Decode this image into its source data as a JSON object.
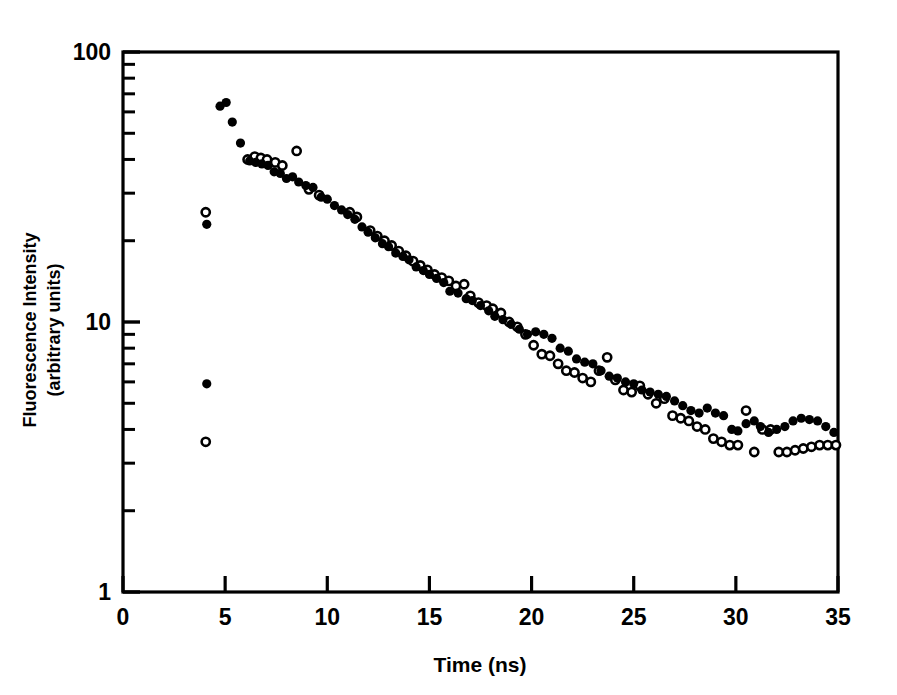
{
  "figure": {
    "name": "fluorescence-decay-plot",
    "background_color": "#ffffff",
    "ink_color": "#000000"
  },
  "axes": {
    "frame": {
      "left": 123,
      "right": 838,
      "top": 52,
      "bottom": 592
    },
    "x": {
      "title": "Time (ns)",
      "min": 0,
      "max": 35,
      "scale": "linear",
      "tick_labels": [
        "0",
        "5",
        "10",
        "15",
        "20",
        "25",
        "30",
        "35"
      ],
      "tick_values": [
        0,
        5,
        10,
        15,
        20,
        25,
        30,
        35
      ]
    },
    "y": {
      "title_line1": "Fluorescence Intensity",
      "title_line2": "(arbitrary units)",
      "min": 1,
      "max": 100,
      "scale": "log",
      "tick_labels": [
        "100",
        "10",
        "1"
      ],
      "tick_values": [
        100,
        10,
        1
      ],
      "minor_ticks": [
        2,
        3,
        4,
        5,
        6,
        7,
        8,
        9,
        20,
        30,
        40,
        50,
        60,
        70,
        80,
        90
      ]
    }
  },
  "chart_data": {
    "type": "scatter",
    "title": "",
    "xlabel": "Time (ns)",
    "ylabel": "Fluorescence Intensity (arbitrary units)",
    "xlim": [
      0,
      35
    ],
    "ylim": [
      1,
      100
    ],
    "yscale": "log",
    "xscale": "linear",
    "grid": false,
    "legend": "none",
    "marker_radius_px": 4.6,
    "series": [
      {
        "name": "filled-circles",
        "marker": "filled-circle",
        "color": "#000000",
        "points": [
          [
            4.1,
            23.0
          ],
          [
            4.1,
            5.9
          ],
          [
            4.75,
            63.0
          ],
          [
            5.05,
            65.0
          ],
          [
            5.35,
            55.0
          ],
          [
            5.75,
            46.0
          ],
          [
            6.2,
            39.5
          ],
          [
            6.5,
            39.0
          ],
          [
            6.8,
            38.5
          ],
          [
            7.1,
            38.0
          ],
          [
            7.4,
            36.0
          ],
          [
            7.7,
            35.5
          ],
          [
            8.0,
            34.0
          ],
          [
            8.3,
            34.5
          ],
          [
            8.6,
            33.0
          ],
          [
            8.95,
            32.0
          ],
          [
            9.3,
            31.5
          ],
          [
            9.7,
            29.0
          ],
          [
            10.0,
            28.5
          ],
          [
            10.35,
            27.0
          ],
          [
            10.7,
            26.0
          ],
          [
            11.0,
            25.0
          ],
          [
            11.35,
            24.0
          ],
          [
            11.7,
            22.5
          ],
          [
            12.0,
            21.5
          ],
          [
            12.35,
            20.5
          ],
          [
            12.7,
            19.5
          ],
          [
            13.0,
            19.0
          ],
          [
            13.35,
            18.0
          ],
          [
            13.7,
            17.5
          ],
          [
            14.0,
            17.0
          ],
          [
            14.35,
            16.0
          ],
          [
            14.7,
            15.5
          ],
          [
            15.0,
            15.0
          ],
          [
            15.35,
            14.5
          ],
          [
            15.7,
            14.0
          ],
          [
            16.0,
            13.0
          ],
          [
            16.4,
            12.8
          ],
          [
            16.8,
            12.2
          ],
          [
            17.1,
            12.0
          ],
          [
            17.5,
            11.5
          ],
          [
            17.9,
            11.0
          ],
          [
            18.2,
            10.5
          ],
          [
            18.6,
            10.2
          ],
          [
            19.0,
            9.8
          ],
          [
            19.4,
            9.4
          ],
          [
            19.8,
            9.0
          ],
          [
            20.2,
            9.2
          ],
          [
            20.6,
            9.0
          ],
          [
            21.0,
            8.7
          ],
          [
            21.4,
            8.0
          ],
          [
            21.8,
            7.8
          ],
          [
            22.2,
            7.3
          ],
          [
            22.6,
            7.1
          ],
          [
            23.0,
            7.0
          ],
          [
            23.4,
            6.6
          ],
          [
            23.8,
            6.3
          ],
          [
            24.2,
            6.2
          ],
          [
            24.6,
            6.0
          ],
          [
            25.0,
            5.9
          ],
          [
            25.4,
            5.6
          ],
          [
            25.8,
            5.5
          ],
          [
            26.2,
            5.4
          ],
          [
            26.6,
            5.3
          ],
          [
            27.0,
            5.1
          ],
          [
            27.4,
            4.9
          ],
          [
            27.8,
            4.7
          ],
          [
            28.2,
            4.6
          ],
          [
            28.6,
            4.8
          ],
          [
            29.0,
            4.6
          ],
          [
            29.4,
            4.5
          ],
          [
            29.8,
            4.0
          ],
          [
            30.1,
            3.95
          ],
          [
            30.5,
            4.2
          ],
          [
            30.9,
            4.3
          ],
          [
            31.2,
            4.1
          ],
          [
            31.6,
            3.9
          ],
          [
            32.0,
            4.0
          ],
          [
            32.4,
            4.1
          ],
          [
            32.8,
            4.3
          ],
          [
            33.2,
            4.4
          ],
          [
            33.6,
            4.35
          ],
          [
            34.0,
            4.3
          ],
          [
            34.4,
            4.1
          ],
          [
            34.8,
            3.9
          ]
        ]
      },
      {
        "name": "open-circles",
        "marker": "open-circle",
        "color": "#000000",
        "points": [
          [
            4.05,
            25.5
          ],
          [
            4.05,
            3.6
          ],
          [
            6.1,
            40.0
          ],
          [
            6.45,
            41.0
          ],
          [
            6.75,
            40.5
          ],
          [
            7.05,
            40.0
          ],
          [
            7.45,
            39.0
          ],
          [
            7.8,
            38.0
          ],
          [
            8.5,
            43.0
          ],
          [
            9.1,
            31.0
          ],
          [
            9.6,
            29.5
          ],
          [
            11.1,
            25.5
          ],
          [
            11.45,
            24.5
          ],
          [
            12.1,
            21.8
          ],
          [
            12.45,
            20.8
          ],
          [
            12.8,
            20.0
          ],
          [
            13.15,
            19.2
          ],
          [
            13.5,
            18.3
          ],
          [
            13.85,
            17.6
          ],
          [
            14.2,
            16.8
          ],
          [
            14.55,
            16.2
          ],
          [
            14.9,
            15.6
          ],
          [
            15.25,
            15.0
          ],
          [
            15.6,
            14.6
          ],
          [
            15.95,
            14.2
          ],
          [
            16.3,
            13.6
          ],
          [
            16.7,
            13.8
          ],
          [
            17.0,
            12.5
          ],
          [
            17.4,
            11.8
          ],
          [
            17.8,
            11.5
          ],
          [
            18.1,
            11.2
          ],
          [
            18.5,
            10.8
          ],
          [
            18.9,
            10.0
          ],
          [
            19.3,
            9.6
          ],
          [
            19.7,
            9.0
          ],
          [
            20.1,
            8.2
          ],
          [
            20.5,
            7.6
          ],
          [
            20.9,
            7.5
          ],
          [
            21.3,
            7.0
          ],
          [
            21.7,
            6.6
          ],
          [
            22.1,
            6.5
          ],
          [
            22.5,
            6.2
          ],
          [
            22.9,
            6.0
          ],
          [
            23.3,
            6.6
          ],
          [
            23.7,
            7.4
          ],
          [
            24.1,
            6.1
          ],
          [
            24.5,
            5.6
          ],
          [
            24.9,
            5.5
          ],
          [
            25.3,
            5.8
          ],
          [
            25.7,
            5.4
          ],
          [
            26.1,
            5.0
          ],
          [
            26.5,
            5.2
          ],
          [
            26.9,
            4.5
          ],
          [
            27.3,
            4.4
          ],
          [
            27.7,
            4.3
          ],
          [
            28.1,
            4.1
          ],
          [
            28.5,
            4.0
          ],
          [
            28.9,
            3.7
          ],
          [
            29.3,
            3.6
          ],
          [
            29.7,
            3.5
          ],
          [
            30.1,
            3.5
          ],
          [
            30.5,
            4.7
          ],
          [
            30.9,
            3.3
          ],
          [
            31.3,
            4.0
          ],
          [
            31.7,
            4.0
          ],
          [
            32.1,
            3.3
          ],
          [
            32.5,
            3.3
          ],
          [
            32.9,
            3.35
          ],
          [
            33.3,
            3.4
          ],
          [
            33.7,
            3.45
          ],
          [
            34.1,
            3.5
          ],
          [
            34.5,
            3.5
          ],
          [
            34.9,
            3.5
          ]
        ]
      }
    ]
  }
}
